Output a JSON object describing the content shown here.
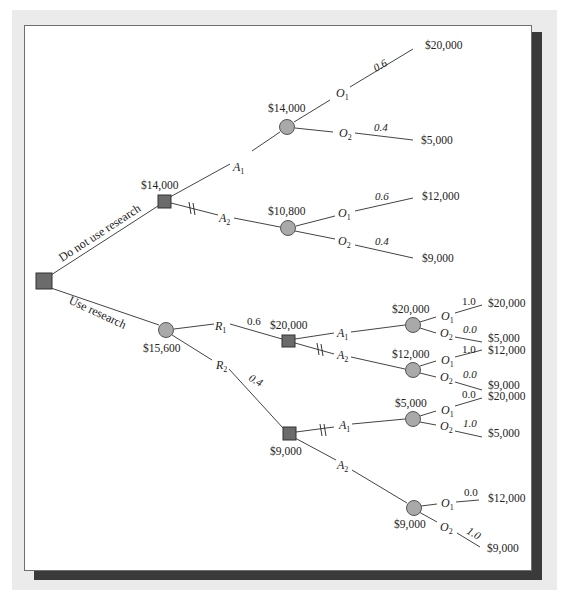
{
  "diagram": {
    "type": "decision-tree",
    "root": {
      "branches": {
        "no_research": "Do not use research",
        "research": "Use research"
      }
    },
    "no_research": {
      "decision_value": "$14,000",
      "a1": {
        "label": "A",
        "sub": "1",
        "ev": "$14,000",
        "o1": {
          "label": "O",
          "sub": "1",
          "prob": "0.6",
          "payoff": "$20,000"
        },
        "o2": {
          "label": "O",
          "sub": "2",
          "prob": "0.4",
          "payoff": "$5,000"
        }
      },
      "a2": {
        "label": "A",
        "sub": "2",
        "ev": "$10,800",
        "o1": {
          "label": "O",
          "sub": "1",
          "prob": "0.6",
          "payoff": "$12,000"
        },
        "o2": {
          "label": "O",
          "sub": "2",
          "prob": "0.4",
          "payoff": "$9,000"
        }
      }
    },
    "research": {
      "ev": "$15,600",
      "r1": {
        "label": "R",
        "sub": "1",
        "prob": "0.6",
        "decision_value": "$20,000",
        "a1": {
          "label": "A",
          "sub": "1",
          "ev": "$20,000",
          "o1": {
            "label": "O",
            "sub": "1",
            "prob": "1.0",
            "payoff": "$20,000"
          },
          "o2": {
            "label": "O",
            "sub": "2",
            "prob": "0.0",
            "payoff": "$5,000"
          }
        },
        "a2": {
          "label": "A",
          "sub": "2",
          "ev": "$12,000",
          "o1": {
            "label": "O",
            "sub": "1",
            "prob": "1.0",
            "payoff": "$12,000"
          },
          "o2": {
            "label": "O",
            "sub": "2",
            "prob": "0.0",
            "payoff": "$9,000"
          }
        }
      },
      "r2": {
        "label": "R",
        "sub": "2",
        "prob": "0.4",
        "decision_value": "$9,000",
        "a1": {
          "label": "A",
          "sub": "1",
          "ev": "$5,000",
          "o1": {
            "label": "O",
            "sub": "1",
            "prob": "0.0",
            "payoff": "$20,000"
          },
          "o2": {
            "label": "O",
            "sub": "2",
            "prob": "1.0",
            "payoff": "$5,000"
          }
        },
        "a2": {
          "label": "A",
          "sub": "2",
          "ev": "$9,000",
          "o1": {
            "label": "O",
            "sub": "1",
            "prob": "0.0",
            "payoff": "$12,000"
          },
          "o2": {
            "label": "O",
            "sub": "2",
            "prob": "1.0",
            "payoff": "$9,000"
          }
        }
      }
    },
    "colors": {
      "decision_node": "#6b6b6b",
      "chance_node": "#a9a9a9",
      "shadow": "#3a3a3a",
      "frame": "#ebebeb"
    }
  }
}
